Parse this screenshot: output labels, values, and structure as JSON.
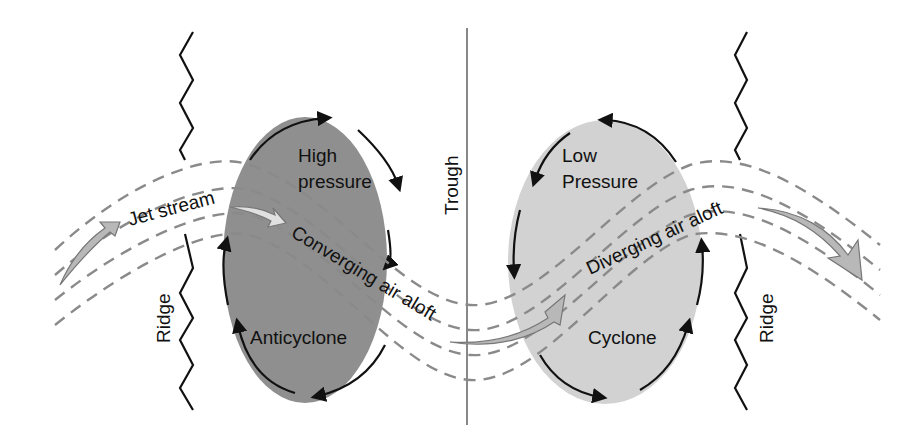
{
  "diagram": {
    "type": "jet stream ridge-trough schematic",
    "labels": {
      "jet_stream": "Jet stream",
      "high_line1": "High",
      "high_line2": "pressure",
      "anticyclone": "Anticyclone",
      "converging": "Converging air aloft",
      "trough": "Trough",
      "low_line1": "Low",
      "low_line2": "Pressure",
      "diverging": "Diverging air aloft",
      "cyclone": "Cyclone",
      "ridge_left": "Ridge",
      "ridge_right": "Ridge"
    },
    "colors": {
      "high_fill": "#8f8f8f",
      "low_fill": "#d2d2d2",
      "dash": "#8a8a8a",
      "arrow_fill": "#b8b8b8",
      "line": "#111111",
      "trough_line": "#888888"
    },
    "nodes": [
      {
        "id": "high",
        "label": "High pressure / Anticyclone",
        "circulation": "clockwise"
      },
      {
        "id": "low",
        "label": "Low Pressure / Cyclone",
        "circulation": "counterclockwise"
      },
      {
        "id": "trough",
        "label": "Trough"
      },
      {
        "id": "ridge-left",
        "label": "Ridge"
      },
      {
        "id": "ridge-right",
        "label": "Ridge"
      }
    ],
    "flows": [
      {
        "from": "ridge-left",
        "to": "high",
        "label": "Converging air aloft"
      },
      {
        "from": "trough",
        "to": "low",
        "label": "Diverging air aloft"
      }
    ]
  }
}
